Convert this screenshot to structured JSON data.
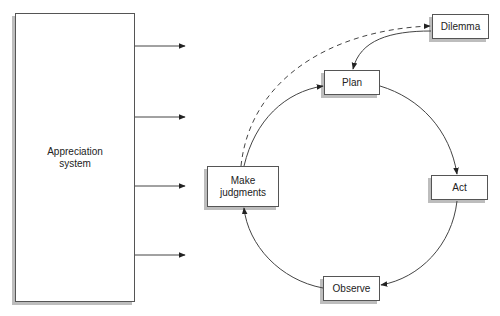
{
  "diagram": {
    "appreciation_system": {
      "label": "Appreciation\nsystem"
    },
    "nodes": {
      "dilemma": {
        "label": "Dilemma"
      },
      "plan": {
        "label": "Plan"
      },
      "act": {
        "label": "Act"
      },
      "observe": {
        "label": "Observe"
      },
      "make_judgments": {
        "label": "Make\njudgments"
      }
    },
    "edges": [
      {
        "from": "appreciation_system",
        "to": "output-1",
        "style": "solid"
      },
      {
        "from": "appreciation_system",
        "to": "output-2",
        "style": "solid"
      },
      {
        "from": "appreciation_system",
        "to": "output-3",
        "style": "solid"
      },
      {
        "from": "appreciation_system",
        "to": "output-4",
        "style": "solid"
      },
      {
        "from": "make_judgments",
        "to": "dilemma",
        "style": "dashed"
      },
      {
        "from": "dilemma",
        "to": "plan",
        "style": "solid"
      },
      {
        "from": "make_judgments",
        "to": "plan",
        "style": "solid"
      },
      {
        "from": "plan",
        "to": "act",
        "style": "solid"
      },
      {
        "from": "act",
        "to": "observe",
        "style": "solid"
      },
      {
        "from": "observe",
        "to": "make_judgments",
        "style": "solid"
      }
    ],
    "colors": {
      "stroke": "#444444",
      "shadow": "#bdbdbd",
      "text": "#222222"
    }
  }
}
